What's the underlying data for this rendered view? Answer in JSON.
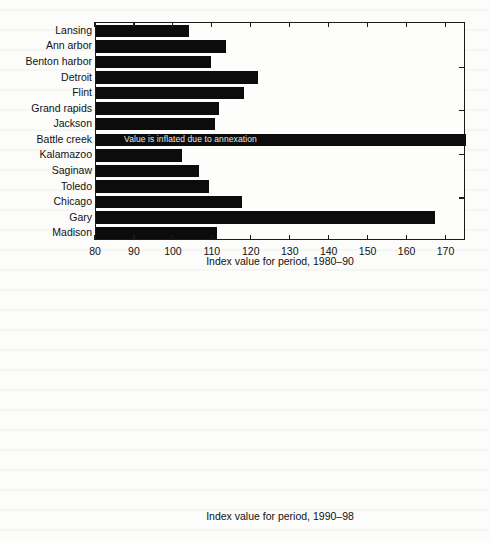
{
  "figure": {
    "background_color": "#fcfcfb",
    "bar_color": "#0c0c0c",
    "axis_color": "#1a1a1a",
    "annotation_text_color": "#e9e9e9"
  },
  "charts": [
    {
      "id": "top",
      "xlabel": "Index value for period, 1980–90",
      "annotation": "Value is inflated due to annexation",
      "annotation_category": "Battle creek",
      "xlim": [
        80,
        175
      ],
      "xticks": [
        80,
        90,
        100,
        110,
        120,
        130,
        140,
        150,
        160,
        170
      ],
      "xticklabels": [
        "80",
        "90",
        "100",
        "110",
        "120",
        "130",
        "140",
        "150",
        "160",
        "170"
      ]
    },
    {
      "id": "bottom",
      "xlabel": "Index value for period, 1990–98",
      "annotation": "",
      "annotation_category": "",
      "xlim": [
        80,
        175
      ],
      "xticks": [
        80,
        90,
        100,
        110,
        120,
        130,
        140,
        150,
        160,
        170
      ],
      "xticklabels": [
        "80",
        "90",
        "100",
        "110",
        "120",
        "130",
        "140",
        "150",
        "160",
        "170"
      ]
    }
  ],
  "chart_data": [
    {
      "type": "bar",
      "orientation": "horizontal",
      "title": "",
      "xlabel": "Index value for period, 1980–90",
      "ylabel": "",
      "xlim": [
        80,
        175
      ],
      "grid": false,
      "legend": false,
      "categories": [
        "Lansing",
        "Ann arbor",
        "Benton harbor",
        "Detroit",
        "Flint",
        "Grand rapids",
        "Jackson",
        "Battle creek",
        "Kalamazoo",
        "Saginaw",
        "Toledo",
        "Chicago",
        "Gary",
        "Madison"
      ],
      "values": [
        104,
        113.5,
        109.5,
        121.5,
        118,
        111.5,
        110.5,
        175,
        102,
        106.5,
        109,
        117.5,
        167,
        111
      ],
      "annotations": [
        {
          "category": "Battle creek",
          "text": "Value is inflated due to annexation"
        }
      ]
    },
    {
      "type": "bar",
      "orientation": "horizontal",
      "title": "",
      "xlabel": "Index value for period, 1990–98",
      "ylabel": "",
      "xlim": [
        80,
        175
      ],
      "grid": false,
      "legend": false,
      "categories": [
        "Lansing",
        "Ann arbor",
        "Benton harbor",
        "Detroit",
        "Flint",
        "Grand rapids",
        "Jackson",
        "Battle creek",
        "Kalamazoo",
        "Saginaw",
        "Toledo",
        "Chicago",
        "Gary",
        "Madison"
      ],
      "values": [
        105.5,
        113.5,
        109,
        114.5,
        113.5,
        116,
        114.5,
        105.5,
        113,
        113.5,
        112.5,
        108,
        113.5,
        98.5
      ],
      "annotations": []
    }
  ]
}
